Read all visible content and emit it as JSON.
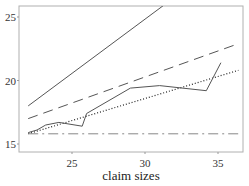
{
  "chart_data": {
    "type": "line",
    "title": "",
    "xlabel": "claim sizes",
    "ylabel": "",
    "xlim": [
      21.5,
      36.4
    ],
    "ylim": [
      14.7,
      26.2
    ],
    "x_ticks": [
      25,
      30,
      35
    ],
    "y_ticks": [
      15,
      20,
      25
    ],
    "x_tick_labels": [
      "25",
      "30",
      "35"
    ],
    "y_tick_labels": [
      "15",
      "20",
      "25"
    ],
    "grid": false,
    "legend": null,
    "series": [
      {
        "name": "solid-steep",
        "style": "solid",
        "color": "#555555",
        "x": [
          22,
          31.6
        ],
        "y": [
          18.0,
          26.2
        ]
      },
      {
        "name": "dashed",
        "style": "dashed",
        "color": "#555555",
        "x": [
          22,
          36.4
        ],
        "y": [
          17.0,
          22.9
        ]
      },
      {
        "name": "dotted",
        "style": "dotted",
        "color": "#222222",
        "x": [
          22,
          36.4
        ],
        "y": [
          15.8,
          20.8
        ]
      },
      {
        "name": "solid-empirical",
        "style": "solid",
        "color": "#555555",
        "x": [
          22,
          22.6,
          23.2,
          24.1,
          25.7,
          26.0,
          29.0,
          31.0,
          34.2,
          35.2
        ],
        "y": [
          15.9,
          16.1,
          16.5,
          16.7,
          16.4,
          17.4,
          19.4,
          19.6,
          19.2,
          21.4
        ]
      },
      {
        "name": "dash-dot",
        "style": "dashdot",
        "color": "#888888",
        "x": [
          22,
          36.4
        ],
        "y": [
          15.8,
          15.8
        ]
      }
    ]
  }
}
